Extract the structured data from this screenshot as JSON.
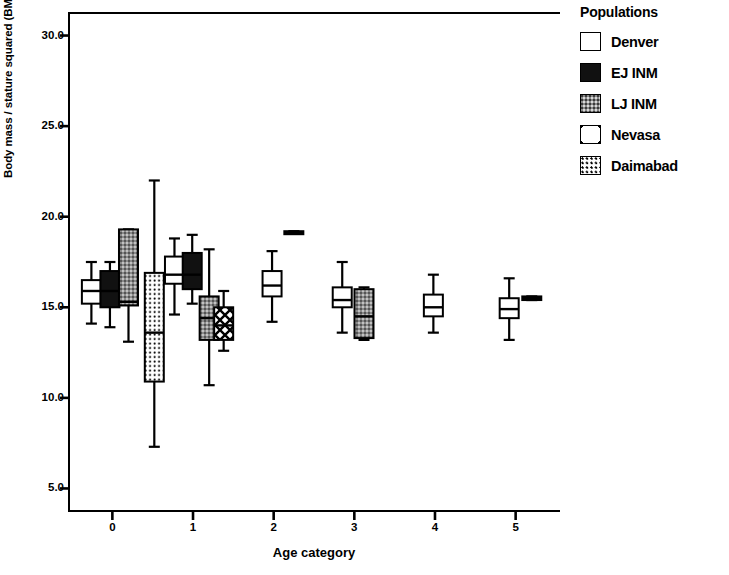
{
  "chart_data": {
    "type": "box",
    "title": "",
    "xlabel": "Age category",
    "ylabel": "Body mass / stature squared (BMI)",
    "ylim": [
      3.7,
      31.3
    ],
    "yticks": [
      5.0,
      10.0,
      15.0,
      20.0,
      25.0,
      30.0
    ],
    "ytick_labels": [
      "5.0",
      "10.0",
      "15.0",
      "20.0",
      "25.0",
      "30.0"
    ],
    "xlim": [
      -0.55,
      5.55
    ],
    "xticks": [
      0,
      1,
      2,
      3,
      4,
      5
    ],
    "xtick_labels": [
      "0",
      "1",
      "2",
      "3",
      "4",
      "5"
    ],
    "grid": false,
    "legend_position": "right",
    "series": [
      {
        "name": "Denver",
        "fill": "white",
        "color": "#ffffff"
      },
      {
        "name": "EJ INM",
        "fill": "solid-black",
        "color": "#111111"
      },
      {
        "name": "LJ INM",
        "fill": "gray-stipple",
        "color": "#8a8a8a"
      },
      {
        "name": "Nevasa",
        "fill": "cross-hatch",
        "color": "#ffffff"
      },
      {
        "name": "Daimabad",
        "fill": "dotted",
        "color": "#ffffff"
      }
    ],
    "boxes": [
      {
        "group": "0",
        "x": -0.26,
        "series": "Denver",
        "whisker_low": 14.1,
        "q1": 15.2,
        "median": 15.9,
        "q3": 16.5,
        "whisker_high": 17.5
      },
      {
        "group": "0",
        "x": -0.03,
        "series": "EJ INM",
        "whisker_low": 13.9,
        "q1": 15.0,
        "median": 15.9,
        "q3": 17.0,
        "whisker_high": 17.5
      },
      {
        "group": "0",
        "x": 0.2,
        "series": "LJ INM",
        "whisker_low": 13.1,
        "q1": 15.1,
        "median": 15.3,
        "q3": 19.3,
        "whisker_high": 19.3
      },
      {
        "group": "1",
        "x": 0.52,
        "series": "Daimabad",
        "whisker_low": 7.3,
        "q1": 10.9,
        "median": 13.6,
        "q3": 16.9,
        "whisker_high": 22.0
      },
      {
        "group": "1",
        "x": 0.77,
        "series": "Denver",
        "whisker_low": 14.6,
        "q1": 16.3,
        "median": 16.8,
        "q3": 17.8,
        "whisker_high": 18.8
      },
      {
        "group": "1",
        "x": 0.99,
        "series": "EJ INM",
        "whisker_low": 15.2,
        "q1": 16.0,
        "median": 16.8,
        "q3": 18.0,
        "whisker_high": 19.0
      },
      {
        "group": "1",
        "x": 1.2,
        "series": "LJ INM",
        "whisker_low": 10.7,
        "q1": 13.2,
        "median": 14.4,
        "q3": 15.6,
        "whisker_high": 18.2
      },
      {
        "group": "1",
        "x": 1.38,
        "series": "Nevasa",
        "whisker_low": 12.6,
        "q1": 13.2,
        "median": 14.0,
        "q3": 15.0,
        "whisker_high": 15.9
      },
      {
        "group": "2",
        "x": 1.98,
        "series": "Denver",
        "whisker_low": 14.2,
        "q1": 15.6,
        "median": 16.2,
        "q3": 17.0,
        "whisker_high": 18.1
      },
      {
        "group": "2",
        "x": 2.25,
        "series": "EJ INM",
        "whisker_low": 19.1,
        "q1": 19.1,
        "median": 19.1,
        "q3": 19.2,
        "whisker_high": 19.2
      },
      {
        "group": "3",
        "x": 2.85,
        "series": "Denver",
        "whisker_low": 13.6,
        "q1": 15.0,
        "median": 15.4,
        "q3": 16.1,
        "whisker_high": 17.5
      },
      {
        "group": "3",
        "x": 3.12,
        "series": "LJ INM",
        "whisker_low": 13.2,
        "q1": 13.3,
        "median": 14.5,
        "q3": 16.0,
        "whisker_high": 16.1
      },
      {
        "group": "4",
        "x": 3.98,
        "series": "Denver",
        "whisker_low": 13.6,
        "q1": 14.5,
        "median": 15.0,
        "q3": 15.7,
        "whisker_high": 16.8
      },
      {
        "group": "5",
        "x": 4.92,
        "series": "Denver",
        "whisker_low": 13.2,
        "q1": 14.4,
        "median": 14.9,
        "q3": 15.5,
        "whisker_high": 16.6
      },
      {
        "group": "5",
        "x": 5.2,
        "series": "EJ INM",
        "whisker_low": 15.4,
        "q1": 15.4,
        "median": 15.5,
        "q3": 15.6,
        "whisker_high": 15.6
      }
    ]
  },
  "legend": {
    "title": "Populations",
    "items": [
      {
        "label": "Denver",
        "swatch": "fill-denver"
      },
      {
        "label": "EJ INM",
        "swatch": "fill-ejinm"
      },
      {
        "label": "LJ INM",
        "swatch": "fill-ljinm"
      },
      {
        "label": "Nevasa",
        "swatch": "fill-nevasa"
      },
      {
        "label": "Daimabad",
        "swatch": "fill-daimabad"
      }
    ]
  }
}
